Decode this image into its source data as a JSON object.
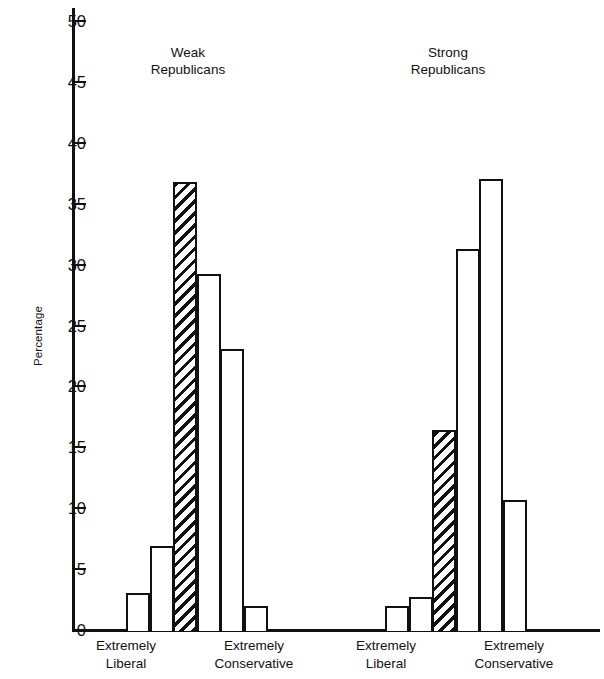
{
  "chart_data": {
    "type": "bar",
    "title": "",
    "xlabel": "",
    "ylabel": "Percentage",
    "ylim": [
      0,
      50
    ],
    "yticks": [
      0,
      5,
      10,
      15,
      20,
      25,
      30,
      35,
      40,
      45,
      50
    ],
    "grid": false,
    "legend": "none",
    "panels": [
      {
        "name": "Weak Republicans",
        "title_line1": "Weak",
        "title_line2": "Republicans",
        "categories": [
          "1",
          "2",
          "3",
          "4",
          "5",
          "6"
        ],
        "values": [
          3.0,
          6.9,
          36.8,
          29.2,
          23.1,
          2.0
        ],
        "highlighted_index": 2,
        "left_axis_label_line1": "Extremely",
        "left_axis_label_line2": "Liberal",
        "right_axis_label_line1": "Extremely",
        "right_axis_label_line2": "Conservative"
      },
      {
        "name": "Strong Republicans",
        "title_line1": "Strong",
        "title_line2": "Republicans",
        "categories": [
          "1",
          "2",
          "3",
          "4",
          "5",
          "6"
        ],
        "values": [
          2.0,
          2.7,
          16.4,
          31.3,
          37.0,
          10.7
        ],
        "highlighted_index": 2,
        "left_axis_label_line1": "Extremely",
        "left_axis_label_line2": "Liberal",
        "right_axis_label_line1": "Extremely",
        "right_axis_label_line2": "Conservative"
      }
    ]
  },
  "axis": {
    "y_label": "Percentage",
    "tick_labels": [
      "0",
      "5",
      "10",
      "15",
      "20",
      "25",
      "30",
      "35",
      "40",
      "45",
      "50"
    ]
  },
  "panels": {
    "left": {
      "title": "Weak\nRepublicans",
      "cat_left": "Extremely\nLiberal",
      "cat_right": "Extremely\nConservative"
    },
    "right": {
      "title": "Strong\nRepublicans",
      "cat_left": "Extremely\nLiberal",
      "cat_right": "Extremely\nConservative"
    }
  },
  "colors": {
    "ink": "#111111",
    "paper": "#ffffff"
  }
}
